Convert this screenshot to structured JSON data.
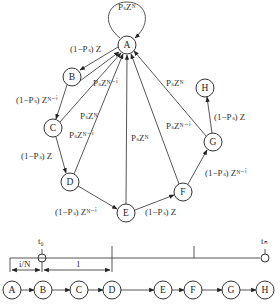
{
  "diagram": {
    "type": "state transition graph with timeline",
    "nodes": [
      {
        "id": "A",
        "label": "A",
        "x": 127,
        "y": 45
      },
      {
        "id": "B",
        "label": "B",
        "x": 72,
        "y": 77
      },
      {
        "id": "C",
        "label": "C",
        "x": 53,
        "y": 128
      },
      {
        "id": "D",
        "label": "D",
        "x": 70,
        "y": 182
      },
      {
        "id": "E",
        "label": "E",
        "x": 126,
        "y": 213
      },
      {
        "id": "F",
        "label": "F",
        "x": 183,
        "y": 192
      },
      {
        "id": "G",
        "label": "G",
        "x": 213,
        "y": 142
      },
      {
        "id": "H",
        "label": "H",
        "x": 205,
        "y": 88
      }
    ],
    "edges": [
      {
        "from": "A",
        "to": "A",
        "label": "P_s Z^N",
        "text": "PₛZᴺ"
      },
      {
        "from": "A",
        "to": "B",
        "label": "(1-P_s) Z",
        "text": "(1−Pₛ) Z"
      },
      {
        "from": "B",
        "to": "A",
        "label": "P_s Z^{N-i}",
        "text": "PₛZᴺ⁻ⁱ"
      },
      {
        "from": "B",
        "to": "C",
        "label": "(1-P_s) Z^{N-i}",
        "text": "(1−Pₛ) Zᴺ⁻ⁱ"
      },
      {
        "from": "C",
        "to": "A",
        "label": "P_s Z^N",
        "text": "PₛZᴺ"
      },
      {
        "from": "C",
        "to": "D",
        "label": "(1-P_s) Z",
        "text": "(1−Pₛ) Z"
      },
      {
        "from": "D",
        "to": "A",
        "label": "P_s Z^{N-i}",
        "text": "PₛZᴺ⁻ⁱ"
      },
      {
        "from": "D",
        "to": "E",
        "label": "(1-P_s) Z^{N-i}",
        "text": "(1−Pₛ) Zᴺ⁻ⁱ"
      },
      {
        "from": "E",
        "to": "A",
        "label": "P_s Z^N",
        "text": "PₛZᴺ"
      },
      {
        "from": "E",
        "to": "F",
        "label": "(1-P_s) Z",
        "text": "(1−Pₛ) Z"
      },
      {
        "from": "F",
        "to": "A",
        "label": "P_s Z^{N-i}",
        "text": "PₛZᴺ⁻ⁱ"
      },
      {
        "from": "F",
        "to": "G",
        "label": "(1-P_s) Z^{N-i}",
        "text": "(1−Pₛ) Zᴺ⁻ⁱ"
      },
      {
        "from": "G",
        "to": "A",
        "label": "P_s Z^N",
        "text": "PₛZᴺ"
      },
      {
        "from": "G",
        "to": "H",
        "label": "(1-P_s) Z",
        "text": "(1−Pₛ) Z"
      }
    ],
    "labels": {
      "self_loop": "PₛZᴺ",
      "ab": "(1−Pₛ) Z",
      "ba": "PₛZᴺ⁻ⁱ",
      "bc": "(1−Pₛ) Zᴺ⁻ⁱ",
      "ca": "PₛZᴺ",
      "cd": "(1−Pₛ) Z",
      "da": "PₛZᴺ⁻ⁱ",
      "de": "(1−Pₛ) Zᴺ⁻ⁱ",
      "ea": "PₛZᴺ",
      "ef": "(1−Pₛ) Z",
      "fa": "PₛZᴺ⁻ⁱ",
      "fg": "(1−Pₛ) Zᴺ⁻ⁱ",
      "ga": "PₛZᴺ",
      "gh": "(1−Pₛ) Z"
    }
  },
  "timeline": {
    "start_label": "t₀",
    "end_label": "tₙ",
    "offset_label": "i/N",
    "unit_label": "1",
    "sequence": [
      "A",
      "B",
      "C",
      "D",
      "E",
      "F",
      "G",
      "H"
    ]
  }
}
